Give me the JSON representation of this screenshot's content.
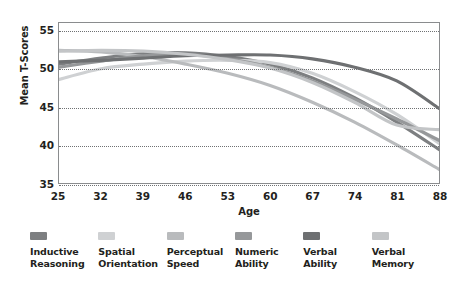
{
  "chart_data": {
    "type": "line",
    "title": "",
    "xlabel": "Age",
    "ylabel": "Mean T-Scores",
    "xlim": [
      25,
      88
    ],
    "ylim": [
      35,
      56
    ],
    "xticks": [
      25,
      32,
      39,
      46,
      53,
      60,
      67,
      74,
      81,
      88
    ],
    "yticks": [
      35,
      40,
      45,
      50,
      55
    ],
    "grid": "horizontal-dotted",
    "legend_position": "below-plot",
    "x": [
      25,
      32,
      39,
      46,
      53,
      60,
      67,
      74,
      81,
      88
    ],
    "series": [
      {
        "name": "Inductive Reasoning",
        "color": "#7d7f81",
        "values": [
          50.6,
          51.4,
          52.0,
          52.1,
          51.6,
          50.6,
          48.8,
          46.2,
          43.0,
          39.4
        ]
      },
      {
        "name": "Spatial Orientation",
        "color": "#cfd1d3",
        "values": [
          48.6,
          50.0,
          50.6,
          51.0,
          51.1,
          50.8,
          49.4,
          47.0,
          44.0,
          40.2
        ]
      },
      {
        "name": "Perceptual Speed",
        "color": "#b9bbbd",
        "values": [
          52.4,
          52.2,
          51.6,
          50.6,
          49.4,
          47.8,
          45.6,
          43.0,
          40.0,
          36.8
        ]
      },
      {
        "name": "Numeric Ability",
        "color": "#96989a",
        "values": [
          50.2,
          51.0,
          51.7,
          51.9,
          51.3,
          50.2,
          48.4,
          46.0,
          43.4,
          40.6
        ]
      },
      {
        "name": "Verbal Ability",
        "color": "#6e7072",
        "values": [
          50.9,
          51.1,
          51.4,
          51.7,
          51.8,
          51.8,
          51.3,
          50.2,
          48.4,
          44.8
        ]
      },
      {
        "name": "Verbal Memory",
        "color": "#c3c5c7",
        "values": [
          52.3,
          52.4,
          52.3,
          51.9,
          51.2,
          50.1,
          48.2,
          45.6,
          42.6,
          42.0
        ]
      }
    ]
  },
  "axes": {
    "ylabel": "Mean T-Scores",
    "xlabel": "Age",
    "yticks": [
      "55",
      "50",
      "45",
      "40",
      "35"
    ],
    "xticks": [
      "25",
      "32",
      "39",
      "46",
      "53",
      "60",
      "67",
      "74",
      "81",
      "88"
    ]
  },
  "legend": {
    "items": [
      {
        "label_line1": "Inductive",
        "label_line2": "Reasoning",
        "color": "#7d7f81"
      },
      {
        "label_line1": "Spatial",
        "label_line2": "Orientation",
        "color": "#cfd1d3"
      },
      {
        "label_line1": "Perceptual",
        "label_line2": "Speed",
        "color": "#b9bbbd"
      },
      {
        "label_line1": "Numeric",
        "label_line2": "Ability",
        "color": "#96989a"
      },
      {
        "label_line1": "Verbal",
        "label_line2": "Ability",
        "color": "#6e7072"
      },
      {
        "label_line1": "Verbal",
        "label_line2": "Memory",
        "color": "#c3c5c7"
      }
    ]
  }
}
